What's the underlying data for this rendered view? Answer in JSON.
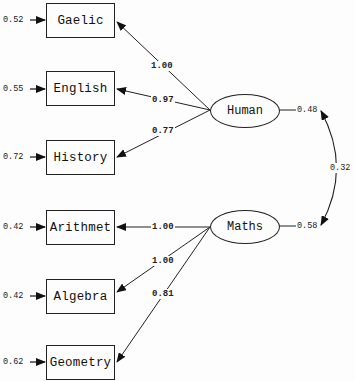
{
  "diagram": {
    "type": "path-diagram (SEM / LISREL)",
    "latent": [
      {
        "id": "human",
        "label": "Human",
        "variance": "0.48"
      },
      {
        "id": "maths",
        "label": "Maths",
        "variance": "0.58"
      }
    ],
    "covariance": {
      "between": [
        "Human",
        "Maths"
      ],
      "value": "0.32"
    },
    "observed": [
      {
        "label": "Gaelic",
        "error": "0.52",
        "loading": "1.00",
        "factor": "Human"
      },
      {
        "label": "English",
        "error": "0.55",
        "loading": "0.97",
        "factor": "Human"
      },
      {
        "label": "History",
        "error": "0.72",
        "loading": "0.77",
        "factor": "Human"
      },
      {
        "label": "Arithmet",
        "error": "0.42",
        "loading": "1.00",
        "factor": "Maths"
      },
      {
        "label": "Algebra",
        "error": "0.42",
        "loading": "1.00",
        "factor": "Maths"
      },
      {
        "label": "Geometry",
        "error": "0.62",
        "loading": "0.81",
        "factor": "Maths"
      }
    ]
  }
}
